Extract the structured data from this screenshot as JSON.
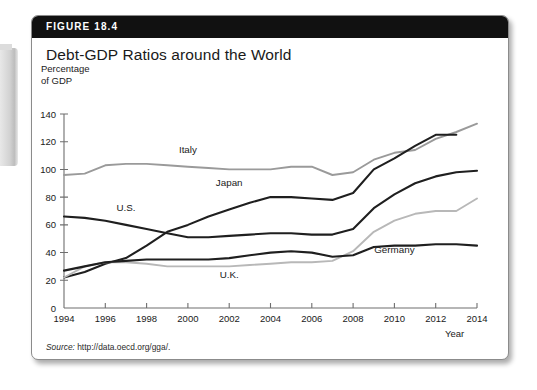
{
  "figure": {
    "number": "FIGURE 18.4",
    "title": "Debt-GDP Ratios around the World",
    "source": "Source: http://data.oecd.org/gga/.",
    "source_label": "Source:",
    "source_url": "http://data.oecd.org/gga/."
  },
  "chart_data": {
    "type": "line",
    "title": "Debt-GDP Ratios around the World",
    "xlabel": "Year",
    "ylabel": "Percentage of GDP",
    "ylabel_line1": "Percentage",
    "ylabel_line2": "of GDP",
    "xlim": [
      1994,
      2014
    ],
    "ylim": [
      0,
      140
    ],
    "yticks": [
      0,
      20,
      40,
      60,
      80,
      100,
      120,
      140
    ],
    "xticks": [
      1994,
      1996,
      1998,
      2000,
      2002,
      2004,
      2006,
      2008,
      2010,
      2012,
      2014
    ],
    "grid": false,
    "legend": "inline-labels",
    "x": [
      1994,
      1995,
      1996,
      1997,
      1998,
      1999,
      2000,
      2001,
      2002,
      2003,
      2004,
      2005,
      2006,
      2007,
      2008,
      2009,
      2010,
      2011,
      2012,
      2013,
      2014
    ],
    "series": [
      {
        "name": "Italy",
        "color": "#9a9a9a",
        "label_x": 2000,
        "label_y": 112,
        "values": [
          96,
          97,
          103,
          104,
          104,
          103,
          102,
          101,
          100,
          100,
          100,
          102,
          102,
          96,
          98,
          107,
          112,
          114,
          122,
          127,
          133
        ]
      },
      {
        "name": "Japan",
        "color": "#1f1f1f",
        "label_x": 2002,
        "label_y": 88,
        "values": [
          22,
          26,
          32,
          36,
          45,
          55,
          60,
          66,
          71,
          76,
          80,
          80,
          79,
          78,
          83,
          100,
          108,
          117,
          125,
          125,
          null
        ]
      },
      {
        "name": "U.S.",
        "color": "#1f1f1f",
        "label_x": 1997,
        "label_y": 70,
        "values": [
          66,
          65,
          63,
          60,
          57,
          54,
          51,
          51,
          52,
          53,
          54,
          54,
          53,
          53,
          57,
          72,
          82,
          90,
          95,
          98,
          99
        ]
      },
      {
        "name": "U.K.",
        "color": "#b8b8b8",
        "label_x": 2002,
        "label_y": 22,
        "values": [
          22,
          30,
          33,
          33,
          32,
          30,
          30,
          30,
          30,
          31,
          32,
          33,
          33,
          34,
          41,
          55,
          63,
          68,
          70,
          70,
          79
        ]
      },
      {
        "name": "Germany",
        "color": "#1f1f1f",
        "label_x": 2010,
        "label_y": 40,
        "values": [
          27,
          30,
          33,
          34,
          35,
          35,
          35,
          35,
          36,
          38,
          40,
          41,
          40,
          37,
          38,
          44,
          45,
          45,
          46,
          46,
          45
        ]
      }
    ]
  }
}
